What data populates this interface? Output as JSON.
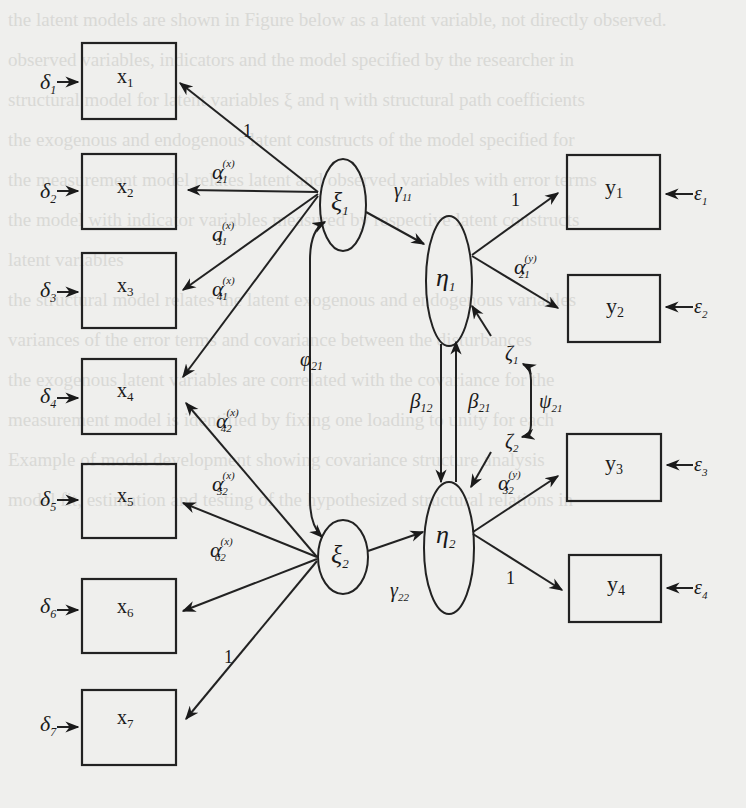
{
  "background_bleed_text": [
    "the latent models are shown in Figure below as a latent variable, not directly observed.",
    "",
    "observed variables, indicators and the model specified by the researcher in",
    "",
    "structural model for latent variables ξ and η with structural path coefficients",
    "the exogenous and endogenous latent constructs of the model specified for",
    "the measurement model relates latent and observed variables with error terms",
    "the model with indicator variables measured by respective latent constructs",
    "latent variables",
    "the structural model relates the latent exogenous and endogenous variables",
    "",
    "variances of the error terms and covariance between the disturbances",
    "",
    "the exogenous latent variables are correlated with the covariance for the",
    "",
    "measurement model is identified by fixing one loading to unity for each",
    "",
    "Example of model development showing covariance structure analysis",
    "model fit, estimation and testing of the hypothesized structural relations in"
  ],
  "diagram": {
    "type": "structural-equation-model",
    "exogenous_indicators": [
      {
        "name": "x",
        "sub": "1",
        "error": "δ",
        "error_sub": "1"
      },
      {
        "name": "x",
        "sub": "2",
        "error": "δ",
        "error_sub": "2"
      },
      {
        "name": "x",
        "sub": "3",
        "error": "δ",
        "error_sub": "3"
      },
      {
        "name": "x",
        "sub": "4",
        "error": "δ",
        "error_sub": "4"
      },
      {
        "name": "x",
        "sub": "5",
        "error": "δ",
        "error_sub": "5"
      },
      {
        "name": "x",
        "sub": "6",
        "error": "δ",
        "error_sub": "6"
      },
      {
        "name": "x",
        "sub": "7",
        "error": "δ",
        "error_sub": "7"
      }
    ],
    "endogenous_indicators": [
      {
        "name": "y",
        "sub": "1",
        "error": "ε",
        "error_sub": "1"
      },
      {
        "name": "y",
        "sub": "2",
        "error": "ε",
        "error_sub": "2"
      },
      {
        "name": "y",
        "sub": "3",
        "error": "ε",
        "error_sub": "3"
      },
      {
        "name": "y",
        "sub": "4",
        "error": "ε",
        "error_sub": "4"
      }
    ],
    "latent_exogenous": [
      {
        "name": "ξ",
        "sub": "1"
      },
      {
        "name": "ξ",
        "sub": "2"
      }
    ],
    "latent_endogenous": [
      {
        "name": "η",
        "sub": "1"
      },
      {
        "name": "η",
        "sub": "2"
      }
    ],
    "x_loadings": [
      {
        "label": "1",
        "from": "ξ1",
        "to": "x1"
      },
      {
        "label": "α",
        "sup": "(x)",
        "sub": "21",
        "from": "ξ1",
        "to": "x2"
      },
      {
        "label": "a",
        "sup": "(x)",
        "sub": "31",
        "from": "ξ1",
        "to": "x3"
      },
      {
        "label": "α",
        "sup": "(x)",
        "sub": "41",
        "from": "ξ1",
        "to": "x4"
      },
      {
        "label": "α",
        "sup": "(x)",
        "sub": "42",
        "from": "ξ2",
        "to": "x4"
      },
      {
        "label": "α",
        "sup": "(x)",
        "sub": "52",
        "from": "ξ2",
        "to": "x5"
      },
      {
        "label": "α",
        "sup": "(x)",
        "sub": "62",
        "from": "ξ2",
        "to": "x6"
      },
      {
        "label": "1",
        "from": "ξ2",
        "to": "x7"
      }
    ],
    "y_loadings": [
      {
        "label": "1",
        "from": "η1",
        "to": "y1"
      },
      {
        "label": "α",
        "sup": "(y)",
        "sub": "21",
        "from": "η1",
        "to": "y2"
      },
      {
        "label": "α",
        "sup": "(y)",
        "sub": "32",
        "from": "η2",
        "to": "y3"
      },
      {
        "label": "1",
        "from": "η2",
        "to": "y4"
      }
    ],
    "structural_paths": [
      {
        "label": "γ",
        "sub": "11",
        "from": "ξ1",
        "to": "η1"
      },
      {
        "label": "γ",
        "sub": "22",
        "from": "ξ2",
        "to": "η2"
      },
      {
        "label": "β",
        "sub": "12",
        "from": "η1",
        "to": "η2"
      },
      {
        "label": "β",
        "sub": "21",
        "from": "η2",
        "to": "η1"
      }
    ],
    "covariances": [
      {
        "label": "φ",
        "sub": "21",
        "between": [
          "ξ1",
          "ξ2"
        ]
      },
      {
        "label": "ψ",
        "sub": "21",
        "between": [
          "ζ1",
          "ζ2"
        ]
      }
    ],
    "disturbances": [
      {
        "name": "ζ",
        "sub": "1",
        "to": "η1"
      },
      {
        "name": "ζ",
        "sub": "2",
        "to": "η2"
      }
    ]
  }
}
